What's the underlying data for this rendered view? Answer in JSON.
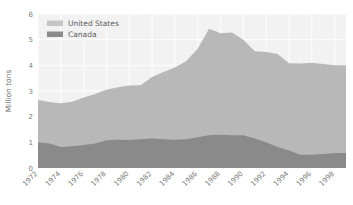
{
  "chart_data": {
    "type": "area",
    "stacked": true,
    "title": "",
    "subtitle": "",
    "xlabel": "",
    "ylabel": "Million tons",
    "xlim": [
      1972,
      1999
    ],
    "ylim": [
      0,
      6
    ],
    "xticks": [
      1972,
      1974,
      1976,
      1978,
      1980,
      1982,
      1984,
      1986,
      1988,
      1990,
      1992,
      1994,
      1996,
      1998
    ],
    "xtick_labels": [
      "1972",
      "1974",
      "1976",
      "1978",
      "1980",
      "1982",
      "1984",
      "1986",
      "1988",
      "1990",
      "1992",
      "1994",
      "1996",
      "1998"
    ],
    "yticks": [
      0,
      1,
      2,
      3,
      4,
      5,
      6
    ],
    "ytick_labels": [
      "0",
      "1",
      "2",
      "3",
      "4",
      "5",
      "6"
    ],
    "grid": true,
    "legend_position": "upper-left",
    "x": [
      1972,
      1973,
      1974,
      1975,
      1976,
      1977,
      1978,
      1979,
      1980,
      1981,
      1982,
      1983,
      1984,
      1985,
      1986,
      1987,
      1988,
      1989,
      1990,
      1991,
      1992,
      1993,
      1994,
      1995,
      1996,
      1997,
      1998,
      1999
    ],
    "series": [
      {
        "name": "Canada",
        "color": "#8a8a8a",
        "values": [
          1.0,
          0.95,
          0.82,
          0.85,
          0.9,
          0.95,
          1.08,
          1.1,
          1.09,
          1.12,
          1.15,
          1.12,
          1.1,
          1.12,
          1.2,
          1.28,
          1.3,
          1.28,
          1.28,
          1.15,
          1.0,
          0.82,
          0.68,
          0.52,
          0.52,
          0.55,
          0.58,
          0.58
        ]
      },
      {
        "name": "United States",
        "color": "#b8b8b8",
        "values": [
          1.65,
          1.62,
          1.7,
          1.73,
          1.85,
          1.93,
          1.97,
          2.05,
          2.12,
          2.1,
          2.4,
          2.62,
          2.82,
          3.05,
          3.45,
          4.15,
          3.95,
          4.0,
          3.72,
          3.4,
          3.52,
          3.62,
          3.4,
          3.55,
          3.58,
          3.5,
          3.42,
          3.42
        ]
      }
    ],
    "totals": [
      2.65,
      2.57,
      2.52,
      2.58,
      2.75,
      2.88,
      3.05,
      3.15,
      3.21,
      3.22,
      3.55,
      3.74,
      3.92,
      4.17,
      4.65,
      5.43,
      5.25,
      5.28,
      5.0,
      4.55,
      4.52,
      4.44,
      4.08,
      4.07,
      4.1,
      4.05,
      4.0,
      4.0
    ]
  },
  "legend": {
    "entries": [
      {
        "label": "United States",
        "swatch_color": "#c6c6c6"
      },
      {
        "label": "Canada",
        "swatch_color": "#8a8a8a"
      }
    ]
  },
  "axis": {
    "y_axis_label": "Million tons"
  },
  "colors": {
    "background": "#ffffff",
    "plot_background": "#f2f2f2",
    "grid": "#ffffff",
    "tick_text": "#7a7a7a",
    "us_area": "#b8b8b8",
    "canada_area": "#8a8a8a"
  }
}
